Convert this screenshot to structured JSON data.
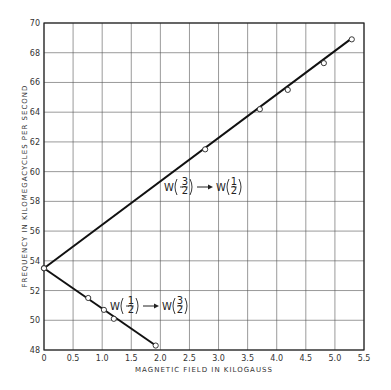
{
  "chart_data": {
    "type": "line",
    "title": "",
    "xlabel": "MAGNETIC FIELD IN KILOGAUSS",
    "ylabel": "FREQUENCY IN KILOMEGACYCLES PER SECOND",
    "xlim": [
      0,
      5.5
    ],
    "ylim": [
      48,
      70
    ],
    "xticks": [
      "0",
      "0.5",
      "1.0",
      "1.5",
      "2.0",
      "2.5",
      "3.0",
      "3.5",
      "4.0",
      "4.5",
      "5.0",
      "5.5"
    ],
    "yticks": [
      "48",
      "50",
      "52",
      "54",
      "56",
      "58",
      "60",
      "62",
      "64",
      "66",
      "68",
      "70"
    ],
    "grid": true,
    "legend": "none (inline annotations)",
    "series": [
      {
        "name": "W(-3/2) → W(1/2)",
        "fit_line": [
          [
            0,
            53.5
          ],
          [
            5.3,
            69.0
          ]
        ],
        "points": [
          [
            0,
            53.5
          ],
          [
            2.77,
            61.5
          ],
          [
            3.71,
            64.2
          ],
          [
            4.19,
            65.5
          ],
          [
            4.81,
            67.3
          ],
          [
            5.29,
            68.9
          ]
        ]
      },
      {
        "name": "W(-1/2) → W(3/2)",
        "fit_line": [
          [
            0,
            53.5
          ],
          [
            1.92,
            48.3
          ]
        ],
        "points": [
          [
            0,
            53.5
          ],
          [
            0.76,
            51.5
          ],
          [
            1.03,
            50.7
          ],
          [
            1.2,
            50.1
          ],
          [
            1.92,
            48.3
          ]
        ]
      }
    ],
    "annotations": [
      {
        "text": "W(−3/2) → W(1/2)",
        "x": 2.0,
        "y": 59.0
      },
      {
        "text": "W(−1/2) → W(3/2)",
        "x": 1.2,
        "y": 51.0
      }
    ]
  },
  "labels": {
    "xlabel": "MAGNETIC FIELD IN KILOGAUSS",
    "ylabel": "FREQUENCY IN KILOMEGACYCLES PER SECOND",
    "ann_upper_w1": "W",
    "ann_upper_num1": "3",
    "ann_upper_w2": "W",
    "ann_upper_num2": "1",
    "ann_lower_w1": "W",
    "ann_lower_num1": "1",
    "ann_lower_w2": "W",
    "ann_lower_num2": "3",
    "den": "2"
  }
}
